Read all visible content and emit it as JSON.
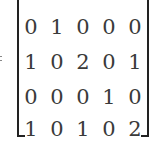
{
  "equation": {
    "lhs_symbol": "=",
    "matrix": [
      [
        "0",
        "1",
        "0",
        "0",
        "0"
      ],
      [
        "1",
        "0",
        "2",
        "0",
        "1"
      ],
      [
        "0",
        "0",
        "0",
        "1",
        "0"
      ],
      [
        "1",
        "0",
        "1",
        "0",
        "2"
      ]
    ]
  }
}
